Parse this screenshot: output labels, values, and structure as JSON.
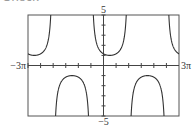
{
  "header": {
    "cut_title": "Check"
  },
  "chart_data": {
    "type": "line",
    "title": "",
    "function": "y = sec((2/3)(x - pi/4))",
    "xlabel": "",
    "ylabel": "",
    "xlim": [
      -9.42478,
      9.42478
    ],
    "ylim": [
      -5,
      5
    ],
    "x_tick_labels": {
      "left": "−3π",
      "right": "3π"
    },
    "y_tick_labels": {
      "top": "5",
      "bottom": "−5"
    },
    "x_tick_step": 1.5708,
    "y_tick_step": 1,
    "grid": false,
    "legend": null,
    "series": [
      {
        "name": "sec curve",
        "branches": [
          {
            "type": "up",
            "center_x": -8.6394,
            "min_y": 1
          },
          {
            "type": "down",
            "center_x": -3.927,
            "max_y": -1
          },
          {
            "type": "up",
            "center_x": 0.7854,
            "min_y": 1
          },
          {
            "type": "down",
            "center_x": 5.4978,
            "max_y": -1
          },
          {
            "type": "up",
            "center_x": 10.2102,
            "min_y": 1
          }
        ]
      }
    ],
    "plot_box": {
      "left": 28,
      "top": 15,
      "right": 179,
      "bottom": 116
    },
    "colors": {
      "curve": "#333333",
      "axis": "#444444",
      "frame": "#555555"
    }
  }
}
